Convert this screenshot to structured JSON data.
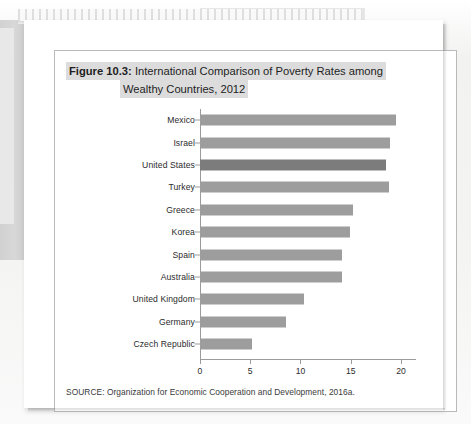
{
  "figure": {
    "label": "Figure 10.3:",
    "title_line1": "International Comparison of Poverty Rates among",
    "title_line2": "Wealthy Countries, 2012",
    "source": "SOURCE: Organization for Economic Cooperation and Development, 2016a."
  },
  "colors": {
    "bar": "#9d9d9d",
    "bar_highlight": "#7c7c7c",
    "axis": "#9b9b9b",
    "title_band": "#dcdcdc",
    "page": "#ffffff",
    "background": "#f3f3f2"
  },
  "chart_data": {
    "type": "bar",
    "orientation": "horizontal",
    "title": "Figure 10.3: International Comparison of Poverty Rates among Wealthy Countries, 2012",
    "xlabel": "",
    "ylabel": "",
    "xlim": [
      0,
      21.5
    ],
    "xticks": [
      0,
      5,
      10,
      15,
      20
    ],
    "xtick_labels": [
      "0",
      "5",
      "10",
      "15",
      "20"
    ],
    "grid": false,
    "legend": null,
    "categories": [
      "Mexico",
      "Israel",
      "United States",
      "Turkey",
      "Greece",
      "Korea",
      "Spain",
      "Australia",
      "United Kingdom",
      "Germany",
      "Czech Republic"
    ],
    "values": [
      19.5,
      18.9,
      18.5,
      18.8,
      15.2,
      14.9,
      14.1,
      14.1,
      10.4,
      8.6,
      5.2
    ],
    "highlight_index": 2
  }
}
